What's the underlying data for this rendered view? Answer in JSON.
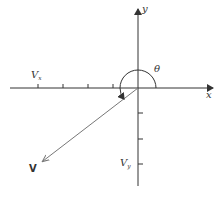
{
  "diagram": {
    "title": "",
    "axes": {
      "x_label": "x",
      "y_label": "y"
    },
    "vector": {
      "label": "V",
      "from": [
        0,
        0
      ],
      "direction": "third-quadrant"
    },
    "components": {
      "vx_main": "V",
      "vx_sub": "x",
      "vy_main": "V",
      "vy_sub": "y"
    },
    "angle": {
      "label": "θ",
      "description": "measured counterclockwise from +x axis to V"
    },
    "ticks": {
      "x_negative_count": 4,
      "y_negative_count": 3
    },
    "colors": {
      "axis": "#333333",
      "vector": "#777777",
      "text": "#333333"
    }
  }
}
